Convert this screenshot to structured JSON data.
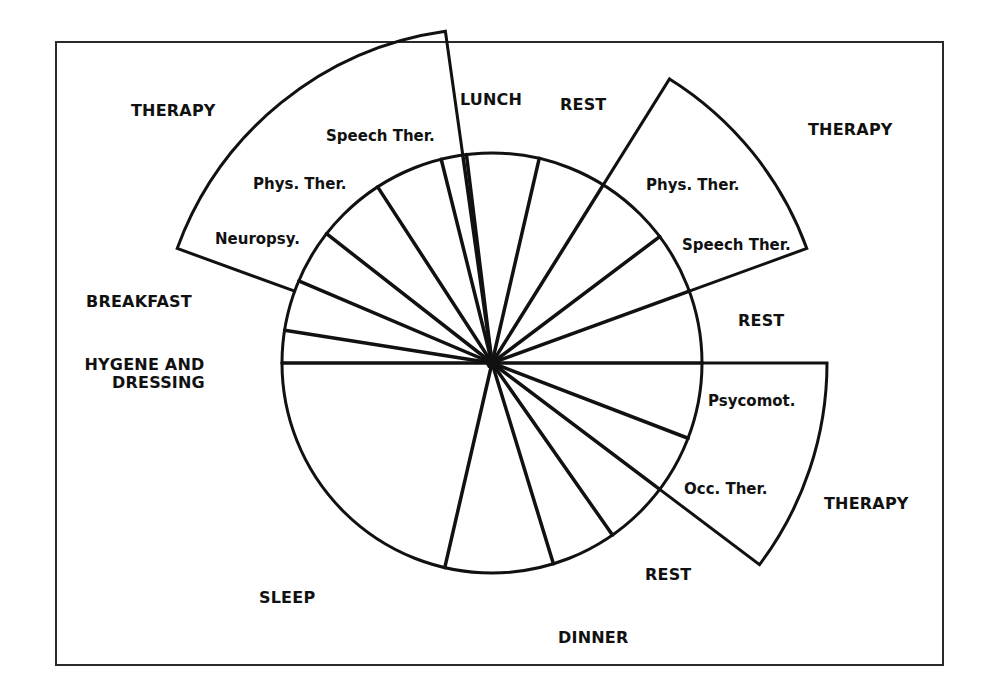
{
  "diagram": {
    "type": "daily-schedule-clock",
    "center": [
      492,
      363
    ],
    "radius": 210,
    "therapy_radius": 335,
    "colors": {
      "stroke": "#111111",
      "background": "#ffffff",
      "frame": "#2a2a2a"
    },
    "spoke_angles_deg": [
      -97,
      -77,
      -58,
      -37,
      -20,
      0,
      21,
      37,
      55,
      73,
      103,
      180,
      189,
      203,
      218,
      237,
      256,
      262
    ],
    "therapy_wedges": [
      {
        "id": "therapy-left",
        "from_deg": 200,
        "to_deg": 262
      },
      {
        "id": "therapy-right",
        "from_deg": -58,
        "to_deg": -20
      },
      {
        "id": "therapy-lower",
        "from_deg": 0,
        "to_deg": 37
      }
    ]
  },
  "labels": {
    "lunch": "LUNCH",
    "rest_top": "REST",
    "therapy_right": "THERAPY",
    "rest_right": "REST",
    "therapy_lower": "THERAPY",
    "rest_bottom": "REST",
    "dinner": "DINNER",
    "sleep": "SLEEP",
    "hygiene_line1": "HYGENE AND",
    "hygiene_line2": "DRESSING",
    "breakfast": "BREAKFAST",
    "therapy_left": "THERAPY"
  },
  "therapy_items": {
    "left": [
      "Speech Ther.",
      "Phys. Ther.",
      "Neuropsy."
    ],
    "right": [
      "Phys. Ther.",
      "Speech Ther."
    ],
    "lower": [
      "Psycomot.",
      "Occ. Ther."
    ]
  }
}
